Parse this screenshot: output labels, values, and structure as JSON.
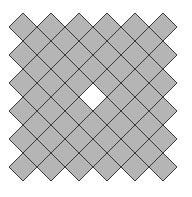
{
  "figure": {
    "canvas": {
      "width": 192,
      "height": 197
    },
    "tile_half_diagonal": 14,
    "spacing": 28,
    "main_grid": {
      "origin_x": 23,
      "origin_y": 27,
      "cols": 6,
      "rows": 6
    },
    "offset_grid": {
      "origin_x": 37,
      "origin_y": 41,
      "cols": 5,
      "rows": 5
    },
    "missing_tile": {
      "grid": "offset",
      "col": 2,
      "row": 2
    },
    "colors": {
      "fill": "#b5b5b5",
      "stroke": "#3a3a3a",
      "hole": "#ffffff",
      "background": "#ffffff"
    }
  }
}
